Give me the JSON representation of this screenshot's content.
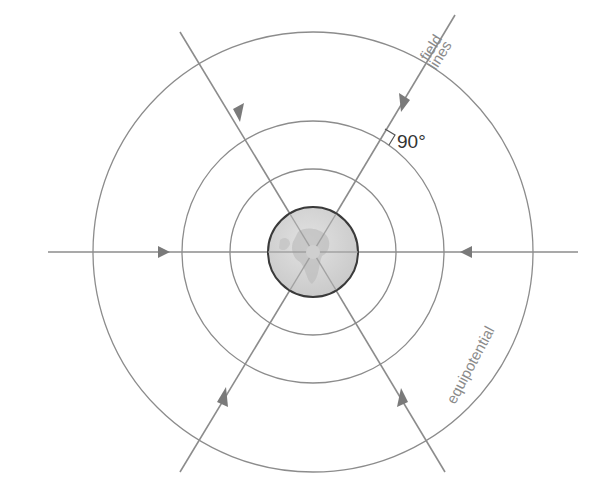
{
  "diagram": {
    "labels": {
      "field_lines_1": "field",
      "field_lines_2": "lines",
      "angle": "90°",
      "equipotential": "equipotential"
    },
    "center": [
      313,
      252
    ],
    "earth_radius": 45,
    "equipotential_radii": [
      83,
      131,
      220
    ],
    "field_line_angles_deg": [
      0,
      60,
      120,
      180,
      240,
      300
    ],
    "colors": {
      "line": "#8c8c8c",
      "earth_fill": "#d6d6d6",
      "earth_stroke": "#3a3a3a",
      "text": "#8a8a8a",
      "angle_text": "#333333"
    }
  }
}
